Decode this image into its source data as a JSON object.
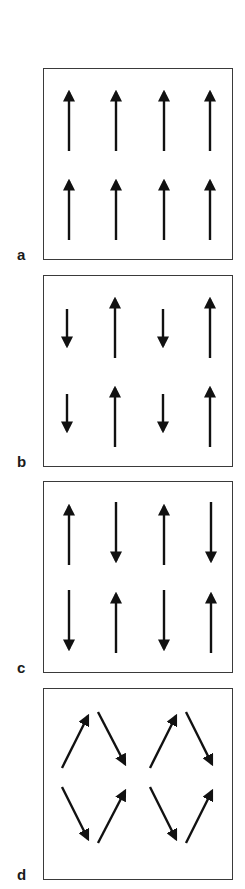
{
  "figure": {
    "panels": [
      {
        "id": "a",
        "label": "a",
        "description": "ferromagnetic - all spins parallel up"
      },
      {
        "id": "b",
        "label": "b",
        "description": "ferrimagnetic - alternating unequal antiparallel spins"
      },
      {
        "id": "c",
        "label": "c",
        "description": "antiferromagnetic - alternating equal antiparallel spins"
      },
      {
        "id": "d",
        "label": "d",
        "description": "canted spin arrangement"
      }
    ],
    "colors": {
      "arrow": "#111111",
      "border": "#3a3a3a",
      "label": "#1a1a1a"
    }
  }
}
